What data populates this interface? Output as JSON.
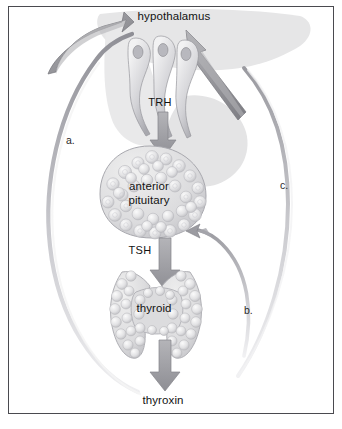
{
  "diagram": {
    "background_color": "#ffffff",
    "border_color": "#4a4a4f",
    "organs": [
      {
        "id": "hypothalamus",
        "label": "hypothalamus",
        "x": 174,
        "y": 16
      },
      {
        "id": "anterior-pituitary",
        "label_line1": "anterior",
        "label_line2": "pituitary",
        "x": 149,
        "y": 186
      },
      {
        "id": "thyroid",
        "label": "thyroid",
        "x": 154,
        "y": 308
      }
    ],
    "hormones": [
      {
        "id": "trh",
        "label": "TRH",
        "x": 160,
        "y": 103,
        "description": "thyrotropin releasing hormone from hypothalamus to anterior pituitary"
      },
      {
        "id": "tsh",
        "label": "TSH",
        "x": 140,
        "y": 251,
        "description": "thyroid stimulating hormone from anterior pituitary to thyroid"
      },
      {
        "id": "thyroxin",
        "label": "thyroxin",
        "x": 163,
        "y": 400,
        "description": "thyroxin secreted by thyroid"
      }
    ],
    "feedback_labels": [
      {
        "id": "a",
        "label": "a.",
        "x": 69,
        "y": 141,
        "description": "long feedback loop arrow curving from lower left up to hypothalamus"
      },
      {
        "id": "b",
        "label": "b.",
        "x": 247,
        "y": 311,
        "description": "short feedback loop arrow curving up to anterior pituitary"
      },
      {
        "id": "c",
        "label": "c.",
        "x": 283,
        "y": 186,
        "description": "long feedback loop arrow curving up to hypothalamus"
      }
    ],
    "palette": {
      "arrow_gray": "#9a9a9e",
      "arrow_gray_dark": "#7e7e84",
      "arrow_outline": "#6f6f76",
      "tissue_fill": "#d8d8da",
      "tissue_light": "#ededee",
      "silhouette": "#e2e2e3",
      "cell_outline": "#b4b4b8",
      "text": "#121212"
    },
    "neurons": {
      "count": 3,
      "description": "three teardrop shaped TRH secreting neurons with nuclei and tails converging downward"
    }
  }
}
